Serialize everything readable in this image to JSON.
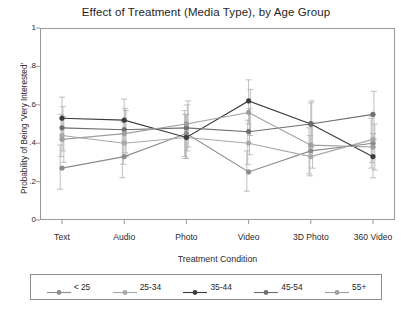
{
  "chart_data": {
    "type": "line",
    "title": "Effect of Treatment (Media Type), by Age Group",
    "xlabel": "Treatment Condition",
    "ylabel": "Probability of Being 'Very Interested'",
    "categories": [
      "Text",
      "Audio",
      "Photo",
      "Video",
      "3D Photo",
      "360 Video"
    ],
    "ylim": [
      0,
      1
    ],
    "yticks": [
      0,
      0.2,
      0.4,
      0.6,
      0.8,
      1
    ],
    "ytick_labels": [
      "0",
      ".2",
      ".4",
      ".6",
      ".8",
      "1"
    ],
    "grid": false,
    "legend_position": "bottom",
    "error_bars": "95% confidence interval",
    "series": [
      {
        "name": "< 25",
        "color": "#8c8c8c",
        "values": [
          0.27,
          0.33,
          0.45,
          0.25,
          0.36,
          0.4
        ],
        "ci_low": [
          0.16,
          0.22,
          0.33,
          0.15,
          0.24,
          0.27
        ],
        "ci_high": [
          0.39,
          0.45,
          0.57,
          0.36,
          0.48,
          0.53
        ]
      },
      {
        "name": "25-34",
        "color": "#a8a8a8",
        "values": [
          0.44,
          0.4,
          0.43,
          0.4,
          0.33,
          0.42
        ],
        "ci_low": [
          0.33,
          0.29,
          0.32,
          0.29,
          0.23,
          0.3
        ],
        "ci_high": [
          0.55,
          0.51,
          0.55,
          0.52,
          0.44,
          0.54
        ]
      },
      {
        "name": "35-44",
        "color": "#3a3a3a",
        "values": [
          0.53,
          0.52,
          0.43,
          0.62,
          0.5,
          0.33
        ],
        "ci_low": [
          0.42,
          0.41,
          0.32,
          0.5,
          0.38,
          0.22
        ],
        "ci_high": [
          0.64,
          0.63,
          0.55,
          0.73,
          0.61,
          0.45
        ]
      },
      {
        "name": "45-54",
        "color": "#6e6e6e",
        "values": [
          0.48,
          0.47,
          0.48,
          0.46,
          0.5,
          0.55
        ],
        "ci_low": [
          0.36,
          0.35,
          0.36,
          0.34,
          0.38,
          0.42
        ],
        "ci_high": [
          0.59,
          0.58,
          0.6,
          0.58,
          0.62,
          0.67
        ]
      },
      {
        "name": "55+",
        "color": "#9e9e9e",
        "values": [
          0.42,
          0.45,
          0.5,
          0.56,
          0.39,
          0.38
        ],
        "ci_low": [
          0.3,
          0.33,
          0.38,
          0.44,
          0.27,
          0.26
        ],
        "ci_high": [
          0.54,
          0.57,
          0.62,
          0.68,
          0.51,
          0.5
        ]
      }
    ]
  },
  "legend": {
    "items": [
      {
        "label": "< 25"
      },
      {
        "label": "25-34"
      },
      {
        "label": "35-44"
      },
      {
        "label": "45-54"
      },
      {
        "label": "55+"
      }
    ]
  }
}
